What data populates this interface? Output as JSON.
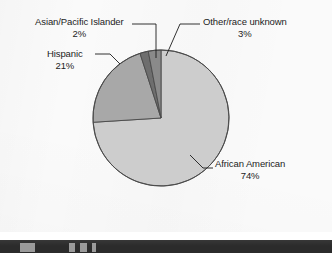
{
  "figure": {
    "background_color": "#fafafa",
    "footer_bar_color": "#2b2b2b"
  },
  "chart_data": {
    "type": "pie",
    "title": "",
    "subtitle": "",
    "xlabel": "",
    "ylabel": "",
    "legend_position": "none",
    "grid": false,
    "start_angle_deg": 0,
    "direction": "clockwise",
    "units": "percent",
    "categories": [
      "African American",
      "Hispanic",
      "Asian/Pacific Islander",
      "Other/race unknown"
    ],
    "values": [
      74,
      21,
      2,
      3
    ],
    "value_labels": [
      "74%",
      "21%",
      "2%",
      "3%"
    ],
    "colors": [
      "#cdcdcd",
      "#a8a8a8",
      "#6e6e6e",
      "#8a8a8a"
    ],
    "slices": [
      {
        "name": "African American",
        "value": 74,
        "value_label": "74%",
        "color": "#cdcdcd",
        "start_deg": 0,
        "end_deg": 266.4
      },
      {
        "name": "Hispanic",
        "value": 21,
        "value_label": "21%",
        "color": "#a8a8a8",
        "start_deg": 266.4,
        "end_deg": 342.0
      },
      {
        "name": "Asian/Pacific Islander",
        "value": 2,
        "value_label": "2%",
        "color": "#6e6e6e",
        "start_deg": 342.0,
        "end_deg": 349.2
      },
      {
        "name": "Other/race unknown",
        "value": 3,
        "value_label": "3%",
        "color": "#8a8a8a",
        "start_deg": 349.2,
        "end_deg": 360.0
      }
    ]
  },
  "labels": {
    "asian": {
      "name": "Asian/Pacific Islander",
      "percent": "2%"
    },
    "hispanic": {
      "name": "Hispanic",
      "percent": "21%"
    },
    "other": {
      "name": "Other/race unknown",
      "percent": "3%"
    },
    "african": {
      "name": "African American",
      "percent": "74%"
    }
  }
}
